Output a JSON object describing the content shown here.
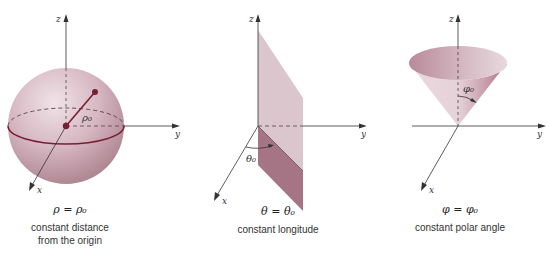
{
  "panels": [
    {
      "id": "sphere",
      "equation": "ρ = ρ₀",
      "caption_line1": "constant distance",
      "caption_line2": "from the origin",
      "shape_label": "ρ₀",
      "axes": {
        "x": "x",
        "y": "y",
        "z": "z"
      }
    },
    {
      "id": "half-plane",
      "equation": "θ = θ₀",
      "caption_line1": "constant longitude",
      "caption_line2": "",
      "shape_label": "θ₀",
      "axes": {
        "x": "x",
        "y": "y",
        "z": "z"
      }
    },
    {
      "id": "cone",
      "equation": "φ = φ₀",
      "caption_line1": "constant polar angle",
      "caption_line2": "",
      "shape_label": "φ₀",
      "axes": {
        "x": "x",
        "y": "y",
        "z": "z"
      }
    }
  ],
  "colors": {
    "surface_light": "#dcc3cb",
    "surface_mid": "#c9a4b1",
    "surface_dark": "#9e6c7d",
    "accent_line": "#7a1f33",
    "axis": "#333333"
  }
}
